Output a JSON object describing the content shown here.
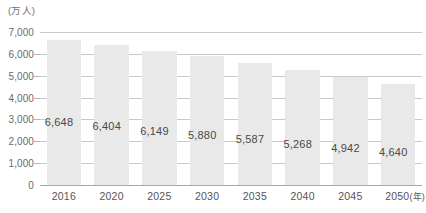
{
  "chart_data": {
    "type": "bar",
    "title": "",
    "subtitle": "",
    "unit_label": "(万人)",
    "xlabel": "(年)",
    "ylabel": "",
    "ylim": [
      0,
      7000
    ],
    "grid": true,
    "legend": null,
    "categories": [
      "2016",
      "2020",
      "2025",
      "2030",
      "2035",
      "2040",
      "2045",
      "2050"
    ],
    "values": [
      6648,
      6404,
      6149,
      5880,
      5587,
      5268,
      4942,
      4640
    ],
    "value_labels": [
      "6,648",
      "6,404",
      "6,149",
      "5,880",
      "5,587",
      "5,268",
      "4,942",
      "4,640"
    ],
    "y_ticks": [
      7000,
      6000,
      5000,
      4000,
      3000,
      2000,
      1000,
      0
    ],
    "y_tick_labels": [
      "7,000",
      "6,000",
      "5,000",
      "4,000",
      "3,000",
      "2,000",
      "1,000",
      "0"
    ],
    "colors": {
      "bar": "#e9e9e9",
      "gridline": "#c9c9c9",
      "axis": "#a8a8a8",
      "tick_text": "#6b6b6b",
      "value_text": "#4a4a4a",
      "background": "#ffffff"
    }
  }
}
